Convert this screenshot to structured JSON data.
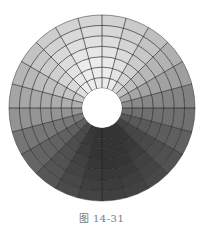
{
  "figure": {
    "caption": "图 14-31"
  },
  "mesh": {
    "center": [
      102,
      108
    ],
    "inner_radius": 20,
    "outer_radius": 93,
    "rings": 7,
    "segments": 24,
    "edge_color": "#1e1e1e",
    "edge_width": 0.8,
    "hole_color": "#ffffff"
  },
  "shading": {
    "light_direction_deg": 100,
    "max_gray": 236,
    "min_gray": 52,
    "radial_falloff": 0.35,
    "notes": "Lightest at top near hole, darkest at bottom outer rim"
  }
}
